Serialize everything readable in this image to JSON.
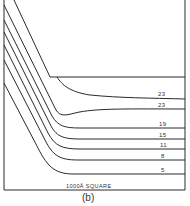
{
  "figure": {
    "caption": "(b)",
    "scale_label": "1000Å SQUARE",
    "line_color": "#2a2a2a",
    "contour_labels": [
      "23",
      "23",
      "19",
      "15",
      "11",
      "8",
      "5"
    ]
  }
}
